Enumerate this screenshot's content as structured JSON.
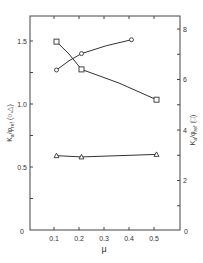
{
  "chart_data": {
    "type": "line",
    "title": "",
    "xlabel": "μ",
    "ylabel_left": "Kₐ / φᵣₑf (○, △)",
    "ylabel_right": "Kₐ / φᵣₑf (□)",
    "xlim": [
      0,
      0.6
    ],
    "ylim_left": [
      0,
      1.7
    ],
    "ylim_right": [
      0,
      8.5
    ],
    "x_ticks": [
      "0.1",
      "0.2",
      "0.3",
      "0.4",
      "0.5"
    ],
    "x_tick_values": [
      0.1,
      0.2,
      0.3,
      0.4,
      0.5
    ],
    "y_left_ticks": [
      "0",
      "0.5",
      "1.0",
      "1.5"
    ],
    "y_left_tick_values": [
      0,
      0.5,
      1.0,
      1.5
    ],
    "y_right_ticks": [
      "0",
      "2",
      "4",
      "6",
      "8"
    ],
    "y_right_tick_values": [
      0,
      2,
      4,
      6,
      8
    ],
    "grid": false,
    "series": [
      {
        "name": "circle",
        "marker": "o",
        "axis": "left",
        "x": [
          0.11,
          0.21,
          0.41
        ],
        "values": [
          1.27,
          1.4,
          1.51
        ]
      },
      {
        "name": "triangle",
        "marker": "^",
        "axis": "left",
        "x": [
          0.11,
          0.21,
          0.51
        ],
        "values": [
          0.59,
          0.58,
          0.6
        ]
      },
      {
        "name": "square",
        "marker": "s",
        "axis": "right",
        "x": [
          0.11,
          0.21,
          0.51
        ],
        "values": [
          7.5,
          6.4,
          5.2
        ]
      }
    ]
  },
  "labels": {
    "origin_left": "0",
    "origin_right": "0",
    "x_axis": "μ",
    "y_left_main": "K",
    "y_left_sub": "a",
    "y_left_mid": "/φ",
    "y_left_sub2": "ref",
    "y_left_suffix": "(○,△)",
    "y_right_main": "K",
    "y_right_sub": "a",
    "y_right_mid": "/φ",
    "y_right_sub2": "ref",
    "y_right_suffix": "(□)"
  }
}
